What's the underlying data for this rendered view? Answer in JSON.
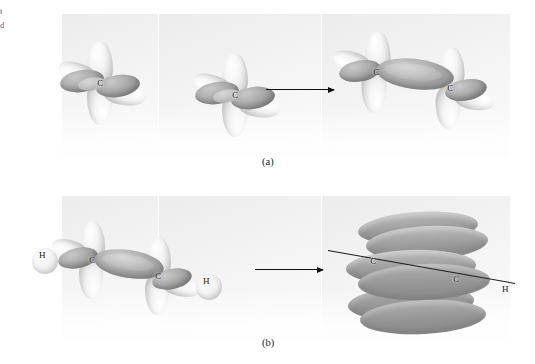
{
  "figure": {
    "background_color": "#ffffff",
    "panel_color": "#f2f2f2",
    "lobe_light_color": "#e8e8e8",
    "lobe_dark_color": "#9b9b9b",
    "ink_color": "#111111"
  },
  "margin_fragments": [
    {
      "text": "t",
      "top": 8
    },
    {
      "text": "d",
      "top": 22
    }
  ],
  "rows": [
    {
      "id": "row-a",
      "label": "(a)",
      "arrow_label": "forms",
      "reactants": [
        {
          "id": "carbon-left",
          "atom_label": "C",
          "description": "carbon atom with four orbital lobes"
        },
        {
          "id": "carbon-right",
          "atom_label": "C",
          "description": "carbon atom with four orbital lobes"
        }
      ],
      "product": {
        "id": "c2-double-bond",
        "atom_labels": [
          "C",
          "C"
        ],
        "description": "two carbon atoms with overlapping orbitals forming a bond"
      }
    },
    {
      "id": "row-b",
      "label": "(b)",
      "arrow_label": "forms",
      "reactant": {
        "id": "acetylene-orbitals",
        "atom_labels": [
          "C",
          "C"
        ],
        "hydrogen_labels": [
          "H",
          "H"
        ],
        "description": "H-C-C-H skeleton with unhybridized p orbitals on each carbon"
      },
      "product": {
        "id": "acetylene-pi-cloud",
        "atom_labels": [
          "C",
          "C"
        ],
        "hydrogen_labels": [
          "H",
          "H"
        ],
        "description": "cylindrical pi electron cloud around the carbon-carbon axis"
      }
    }
  ]
}
